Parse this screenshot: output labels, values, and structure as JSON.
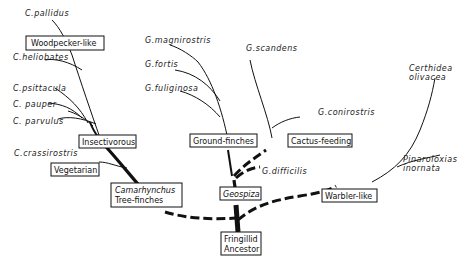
{
  "diagram": {
    "type": "phylogenetic-tree",
    "root": {
      "id": "ancestor",
      "label_lines": [
        "Fringillid",
        "Ancestor"
      ]
    },
    "groups": [
      {
        "id": "tree-finches",
        "label_lines": [
          "Camarhynchus",
          "Tree-finches"
        ],
        "genus_italic": true
      },
      {
        "id": "geospiza",
        "label": "Geospiza",
        "italic": true
      },
      {
        "id": "warbler",
        "label": "Warbler-like"
      },
      {
        "id": "insectivorous",
        "label": "Insectivorous"
      },
      {
        "id": "vegetarian",
        "label": "Vegetarian"
      },
      {
        "id": "woodpecker",
        "label": "Woodpecker-like"
      },
      {
        "id": "ground",
        "label": "Ground-finches"
      },
      {
        "id": "cactus",
        "label": "Cactus-feeding"
      }
    ],
    "species": [
      {
        "id": "pallidus",
        "label": "C.pallidus"
      },
      {
        "id": "heliobates",
        "label": "C.heliobates"
      },
      {
        "id": "psittacula",
        "label": "C.psittacula"
      },
      {
        "id": "pauper",
        "label": "C. pauper"
      },
      {
        "id": "parvulus",
        "label": "C. parvulus"
      },
      {
        "id": "crassirostris",
        "label": "C.crassirostris"
      },
      {
        "id": "magnirostris",
        "label": "G.magnirostris"
      },
      {
        "id": "fortis",
        "label": "G.fortis"
      },
      {
        "id": "fuliginosa",
        "label": "G.fuliginosa"
      },
      {
        "id": "scandens",
        "label": "G.scandens"
      },
      {
        "id": "conirostris",
        "label": "G.conirostris"
      },
      {
        "id": "difficilis",
        "label": "G.difficilis"
      },
      {
        "id": "certhidea",
        "label_lines": [
          "Certhidea",
          "olivacea"
        ]
      },
      {
        "id": "pinaroloxias",
        "label_lines": [
          "Pinaroloxias",
          "inornata"
        ]
      }
    ]
  }
}
